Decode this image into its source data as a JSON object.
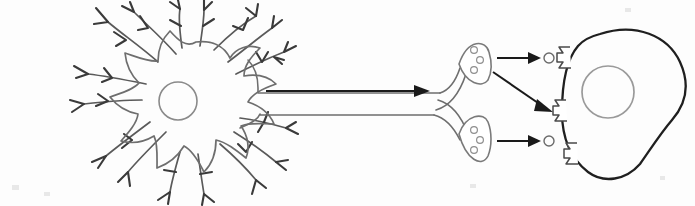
{
  "figure": {
    "type": "line-art biological diagram",
    "background_color": "#fdfdfd",
    "width": 695,
    "height": 206,
    "has_text_labels": false
  },
  "palette": {
    "soma_outline": "#6e6e6e",
    "dendrite_outline": "#5a5a5a",
    "dendrite_twig": "#3a3a3a",
    "nucleus_outline": "#8a8a8a",
    "axon_outline": "#6e6e6e",
    "bouton_outline": "#7a7a7a",
    "vesicle_outline": "#8f8f8f",
    "target_cell_outline": "#1f1f1f",
    "target_nucleus_outline": "#9a9a9a",
    "receptor_outline": "#4a4a4a",
    "neurotransmitter_outline": "#6a6a6a",
    "arrow_color": "#1a1a1a",
    "fill": "#ffffff"
  },
  "parts": {
    "soma": {
      "name": "cell body (soma)",
      "center": [
        196,
        103
      ],
      "radius": 62,
      "lobes": 9
    },
    "nucleus": {
      "name": "nucleus",
      "center": [
        178,
        101
      ],
      "radius": 19
    },
    "dendrites": {
      "name": "dendrites",
      "count": 9,
      "description": "branched processes radiating from the soma, each ending in small Y-shaped twigs"
    },
    "axon": {
      "name": "axon",
      "start": [
        252,
        92
      ],
      "end": [
        432,
        104
      ],
      "tube_width": 22,
      "signal_arrow": {
        "name": "signal propagation arrow",
        "from": [
          266,
          91
        ],
        "to": [
          420,
          91
        ],
        "direction": "left-to-right"
      }
    },
    "axon_branch": {
      "name": "axon bifurcation",
      "point": [
        440,
        104
      ],
      "branches": 2
    },
    "terminals": [
      {
        "name": "upper axon terminal (synaptic bouton)",
        "center": [
          472,
          57
        ],
        "vesicle_count": 3
      },
      {
        "name": "lower axon terminal (synaptic bouton)",
        "center": [
          472,
          141
        ],
        "vesicle_count": 3
      }
    ],
    "release_arrows": [
      {
        "name": "upper neurotransmitter release arrow",
        "from": [
          492,
          58
        ],
        "to": [
          536,
          58
        ]
      },
      {
        "name": "diagonal neurotransmitter release arrow",
        "from": [
          492,
          72
        ],
        "to": [
          548,
          110
        ]
      },
      {
        "name": "lower neurotransmitter release arrow",
        "from": [
          492,
          141
        ],
        "to": [
          536,
          141
        ]
      }
    ],
    "neurotransmitters": [
      {
        "name": "neurotransmitter molecule upper",
        "center": [
          546,
          58
        ],
        "radius": 5
      },
      {
        "name": "neurotransmitter molecule lower",
        "center": [
          546,
          141
        ],
        "radius": 5
      }
    ],
    "receptors": [
      {
        "name": "receptor upper",
        "position": [
          566,
          56
        ]
      },
      {
        "name": "receptor middle",
        "position": [
          566,
          110
        ]
      },
      {
        "name": "receptor lower",
        "position": [
          566,
          154
        ]
      }
    ],
    "target_cell": {
      "name": "target cell (postsynaptic cell)",
      "center": [
        618,
        100
      ],
      "nucleus_center": [
        606,
        92
      ],
      "nucleus_radius": 26
    }
  }
}
